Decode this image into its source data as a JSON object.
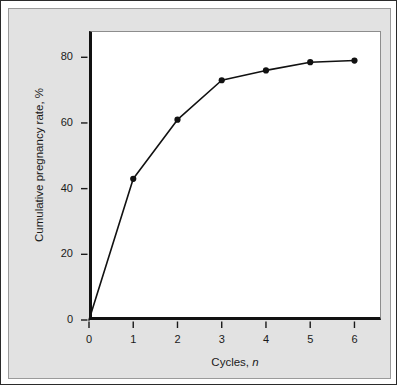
{
  "chart_data": {
    "type": "line",
    "title": "",
    "subtitle": "",
    "xlabel": "Cycles, n",
    "xlabel_text": "Cycles,",
    "xlabel_variable": "n",
    "ylabel": "Cumulative pregnancy rate, %",
    "x": [
      0,
      1,
      2,
      3,
      4,
      5,
      6
    ],
    "values": [
      0,
      43,
      61,
      73,
      76,
      78.5,
      79
    ],
    "series": [
      {
        "name": "Cumulative pregnancy rate",
        "x": [
          0,
          1,
          2,
          3,
          4,
          5,
          6
        ],
        "values": [
          0,
          43,
          61,
          73,
          76,
          78.5,
          79
        ]
      }
    ],
    "xlim": [
      0,
      6.6
    ],
    "ylim": [
      0,
      88
    ],
    "xticks": [
      0,
      1,
      2,
      3,
      4,
      5,
      6
    ],
    "yticks": [
      0,
      20,
      40,
      60,
      80
    ],
    "xtick_labels": [
      "0",
      "1",
      "2",
      "3",
      "4",
      "5",
      "6"
    ],
    "ytick_labels": [
      "0",
      "20",
      "40",
      "60",
      "80"
    ],
    "grid": false,
    "legend": null,
    "marker": "filled-circle",
    "line_color": "#111111",
    "marker_color": "#111111",
    "plot_background": "#ffffff",
    "figure_background": "#e2e2e2",
    "axis_color": "#111111"
  },
  "axes": {
    "y_title": "Cumulative pregnancy rate, %",
    "x_title_text": "Cycles,",
    "x_title_variable": "n"
  }
}
